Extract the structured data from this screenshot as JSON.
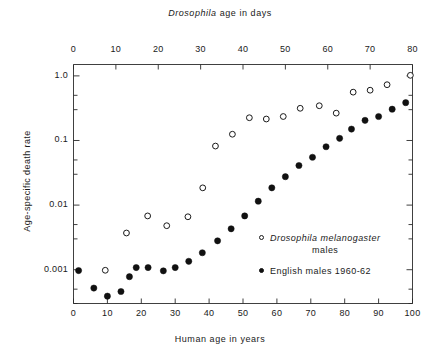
{
  "chart_data": {
    "type": "scatter",
    "title": "",
    "xlabel": "Human age in years",
    "xlabel_top": "Drosophila age in days",
    "ylabel": "Age-specific death rate",
    "yscale": "log",
    "ylim": [
      0.0003,
      1.5
    ],
    "y_ticks": [
      "1.0",
      "0.1",
      "0.01",
      "0.001"
    ],
    "y_tick_values": [
      1.0,
      0.1,
      0.01,
      0.001
    ],
    "xlim_bottom": [
      0,
      100
    ],
    "xlim_top": [
      0,
      80
    ],
    "x_ticks_bottom": [
      "0",
      "10",
      "20",
      "30",
      "40",
      "50",
      "60",
      "70",
      "80",
      "90",
      "100"
    ],
    "x_tick_values_bottom": [
      0,
      10,
      20,
      30,
      40,
      50,
      60,
      70,
      80,
      90,
      100
    ],
    "x_ticks_top": [
      "0",
      "10",
      "20",
      "30",
      "40",
      "50",
      "60",
      "70",
      "80"
    ],
    "x_tick_values_top": [
      0,
      10,
      20,
      30,
      40,
      50,
      60,
      70,
      80
    ],
    "grid": false,
    "legend_position": "inside-lower-right",
    "series": [
      {
        "name": "Drosophila melanogaster males",
        "marker": "open-circle",
        "color": "#1a1a1a",
        "x_axis": "top",
        "points": [
          [
            7.5,
            0.00098
          ],
          [
            12.5,
            0.0037
          ],
          [
            17.5,
            0.0068
          ],
          [
            22.0,
            0.0048
          ],
          [
            27.0,
            0.0066
          ],
          [
            30.5,
            0.0185
          ],
          [
            33.5,
            0.082
          ],
          [
            37.5,
            0.125
          ],
          [
            41.5,
            0.225
          ],
          [
            45.5,
            0.215
          ],
          [
            49.5,
            0.235
          ],
          [
            53.5,
            0.315
          ],
          [
            58.0,
            0.345
          ],
          [
            62.0,
            0.265
          ],
          [
            66.0,
            0.56
          ],
          [
            70.0,
            0.6
          ],
          [
            74.0,
            0.73
          ],
          [
            79.5,
            1.02
          ]
        ]
      },
      {
        "name": "English males 1960-62",
        "marker": "filled-circle",
        "color": "#111111",
        "x_axis": "bottom",
        "points": [
          [
            1.5,
            0.00097
          ],
          [
            6.0,
            0.00052
          ],
          [
            10.0,
            0.00039
          ],
          [
            14.0,
            0.00046
          ],
          [
            16.5,
            0.00078
          ],
          [
            18.5,
            0.00108
          ],
          [
            22.0,
            0.00108
          ],
          [
            26.5,
            0.00096
          ],
          [
            30.0,
            0.00108
          ],
          [
            34.0,
            0.00135
          ],
          [
            38.0,
            0.00183
          ],
          [
            42.5,
            0.0028
          ],
          [
            46.5,
            0.0043
          ],
          [
            50.5,
            0.0068
          ],
          [
            54.5,
            0.0115
          ],
          [
            58.5,
            0.0185
          ],
          [
            62.5,
            0.0275
          ],
          [
            66.5,
            0.041
          ],
          [
            70.5,
            0.055
          ],
          [
            74.5,
            0.08
          ],
          [
            78.5,
            0.108
          ],
          [
            82.0,
            0.15
          ],
          [
            86.0,
            0.205
          ],
          [
            90.0,
            0.235
          ],
          [
            94.0,
            0.305
          ],
          [
            98.0,
            0.385
          ]
        ]
      }
    ]
  },
  "legend": {
    "items": [
      {
        "marker": "open-circle",
        "label_italic": "Drosophila melanogaster",
        "label_sub": "males"
      },
      {
        "marker": "filled-circle",
        "label": "English males 1960-62"
      }
    ]
  }
}
